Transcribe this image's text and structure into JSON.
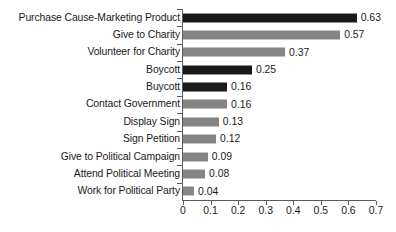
{
  "chart_data": {
    "type": "bar",
    "orientation": "horizontal",
    "title": "",
    "subtitle": "",
    "xlabel": "",
    "ylabel": "",
    "xlim": [
      0,
      0.7
    ],
    "grid": false,
    "legend": null,
    "xticks": [
      "0",
      "0.1",
      "0.2",
      "0.3",
      "0.4",
      "0.5",
      "0.6",
      "0.7"
    ],
    "xtick_values": [
      0,
      0.1,
      0.2,
      0.3,
      0.4,
      0.5,
      0.6,
      0.7
    ],
    "categories": [
      "Purchase Cause-Marketing Product",
      "Give to Charity",
      "Volunteer for Charity",
      "Boycott",
      "Buycott",
      "Contact Government",
      "Display Sign",
      "Sign Petition",
      "Give to Political Campaign",
      "Attend Political Meeting",
      "Work for Political Party"
    ],
    "values": [
      0.63,
      0.57,
      0.37,
      0.25,
      0.16,
      0.16,
      0.13,
      0.12,
      0.09,
      0.08,
      0.04
    ],
    "value_labels": [
      "0.63",
      "0.57",
      "0.37",
      "0.25",
      "0.16",
      "0.16",
      "0.13",
      "0.12",
      "0.09",
      "0.08",
      "0.04"
    ],
    "bar_colors": [
      "#1a1a1a",
      "#858585",
      "#858585",
      "#1a1a1a",
      "#1a1a1a",
      "#858585",
      "#858585",
      "#858585",
      "#858585",
      "#858585",
      "#858585"
    ]
  },
  "colors": {
    "dark_bar": "#1a1a1a",
    "gray_bar": "#858585",
    "axis": "#5a5a5a",
    "text": "#1a1a1a",
    "background": "#ffffff"
  }
}
